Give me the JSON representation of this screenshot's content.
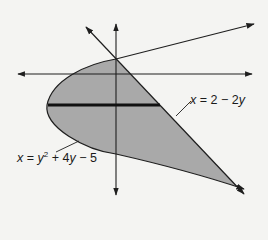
{
  "diagram": {
    "type": "region-between-curves",
    "colors": {
      "background": "#f4f4f2",
      "shade": "#a9a9a9",
      "stroke": "#1e1e1e",
      "strip": "#111111"
    },
    "curves": [
      {
        "id": "line",
        "equation": "x = 2 - 2y",
        "label_parts": [
          "x",
          " = 2 − 2",
          "y"
        ]
      },
      {
        "id": "parabola",
        "equation": "x = y^2 + 4y - 5",
        "label_parts": [
          "x",
          " = ",
          "y",
          "2",
          " + 4",
          "y",
          " − 5"
        ]
      }
    ],
    "intersections": [
      {
        "x": 0,
        "y": 1
      },
      {
        "x": 16,
        "y": -7
      }
    ],
    "parabola_vertex": {
      "x": -9,
      "y": -2
    },
    "shaded_region": "between parabola and line for -7 ≤ y ≤ 1",
    "strip": "horizontal representative rectangle at y = -2"
  },
  "labels": {
    "line": {
      "x": "x",
      "rest": " = 2 − 2",
      "y": "y"
    },
    "parabola": {
      "x": "x",
      "eq": " = ",
      "y": "y",
      "sup": "2",
      "mid": " + 4",
      "y2": "y",
      "end": " − 5"
    }
  }
}
